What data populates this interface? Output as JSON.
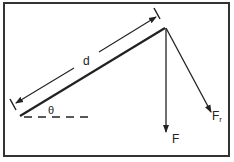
{
  "diagram": {
    "labels": {
      "distance": "d",
      "angle": "θ",
      "force": "F",
      "force_r_main": "F",
      "force_r_sub": "r"
    },
    "colors": {
      "line": "#222222",
      "border": "#333333",
      "background": "#ffffff"
    }
  }
}
